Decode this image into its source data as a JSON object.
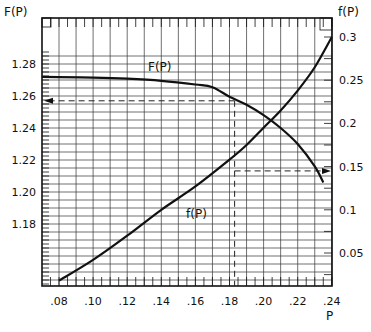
{
  "chart_data": {
    "type": "line",
    "title": "",
    "xlabel": "P",
    "ylabel_left": "F(P)",
    "ylabel_right": "f(P)",
    "xlim": [
      0.07,
      0.24
    ],
    "ylim_left": [
      1.14,
      1.292
    ],
    "ylim_right": [
      0.0,
      0.31
    ],
    "grid": true,
    "x_ticks": [
      ".08",
      ".10",
      ".12",
      ".14",
      ".16",
      ".18",
      ".20",
      ".22",
      ".24"
    ],
    "x_tick_values": [
      0.08,
      0.1,
      0.12,
      0.14,
      0.16,
      0.18,
      0.2,
      0.22,
      0.24
    ],
    "y_left_ticks": [
      "1.28",
      "1.26",
      "1.24",
      "1.22",
      "1.20",
      "1.18"
    ],
    "y_left_tick_values": [
      1.28,
      1.26,
      1.24,
      1.22,
      1.2,
      1.18
    ],
    "y_right_ticks": [
      "0.3",
      "0.25",
      "0.2",
      "0.15",
      "0.1",
      "0.05"
    ],
    "y_right_tick_values": [
      0.3,
      0.25,
      0.2,
      0.15,
      0.1,
      0.05
    ],
    "series": [
      {
        "name": "F(P)",
        "axis": "left",
        "label": "F(P)",
        "x": [
          0.07,
          0.08,
          0.1,
          0.12,
          0.14,
          0.16,
          0.17,
          0.18,
          0.19,
          0.2,
          0.21,
          0.22,
          0.23,
          0.235
        ],
        "values": [
          1.272,
          1.2718,
          1.2715,
          1.2708,
          1.2695,
          1.2672,
          1.2655,
          1.2595,
          1.2545,
          1.248,
          1.24,
          1.23,
          1.216,
          1.206
        ]
      },
      {
        "name": "f(P)",
        "axis": "right",
        "label": "f(P)",
        "x": [
          0.08,
          0.1,
          0.12,
          0.14,
          0.16,
          0.18,
          0.19,
          0.2,
          0.21,
          0.22,
          0.23,
          0.24
        ],
        "values": [
          0.018,
          0.042,
          0.07,
          0.1,
          0.127,
          0.158,
          0.175,
          0.195,
          0.215,
          0.238,
          0.265,
          0.3
        ]
      }
    ],
    "annotations": [
      {
        "type": "dashed-guide",
        "description": "Vertical dashed line at P≈0.183",
        "x": 0.183
      },
      {
        "type": "dashed-arrow",
        "description": "Horizontal dashed arrow to left axis at F(P)≈1.257",
        "y_left": 1.257
      },
      {
        "type": "dashed-arrow",
        "description": "Horizontal dashed arrow to right axis at f(P)≈0.145",
        "y_right": 0.145
      }
    ]
  }
}
